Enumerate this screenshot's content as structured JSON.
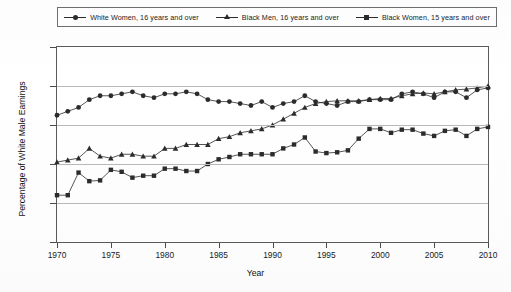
{
  "legend": {
    "entries": [
      {
        "label": "White Women, 16 years and over",
        "marker": "circle",
        "color": "#2b2b2b"
      },
      {
        "label": "Black Men, 16 years and over",
        "marker": "triangle",
        "color": "#2b2b2b"
      },
      {
        "label": "Black Women, 15 years and over",
        "marker": "square",
        "color": "#2b2b2b"
      }
    ]
  },
  "axes": {
    "y_title": "Percentage of White Male Earnings",
    "x_title": "Year",
    "y_ticks": [
      "0.90",
      "0.80",
      "0.70",
      "0.60",
      "0.50",
      "0.40"
    ],
    "x_ticks": [
      "1970",
      "1975",
      "1980",
      "1985",
      "1990",
      "1995",
      "2000",
      "2005",
      "2010"
    ]
  },
  "chart_data": {
    "type": "line",
    "title": "",
    "xlabel": "Year",
    "ylabel": "Percentage of White Male Earnings",
    "xlim": [
      1970,
      2010
    ],
    "ylim": [
      0.4,
      0.9
    ],
    "ytick_values": [
      0.9,
      0.8,
      0.7,
      0.6,
      0.5,
      0.4
    ],
    "xtick_values": [
      1970,
      1975,
      1980,
      1985,
      1990,
      1995,
      2000,
      2005,
      2010
    ],
    "grid": "horizontal",
    "legend_position": "top",
    "x": [
      1970,
      1971,
      1972,
      1973,
      1974,
      1975,
      1976,
      1977,
      1978,
      1979,
      1980,
      1981,
      1982,
      1983,
      1984,
      1985,
      1986,
      1987,
      1988,
      1989,
      1990,
      1991,
      1992,
      1993,
      1994,
      1995,
      1996,
      1997,
      1998,
      1999,
      2000,
      2001,
      2002,
      2003,
      2004,
      2005,
      2006,
      2007,
      2008,
      2009,
      2010
    ],
    "series": [
      {
        "name": "White Women, 16 years and over",
        "marker": "circle",
        "color": "#2b2b2b",
        "values": [
          0.725,
          0.735,
          0.745,
          0.765,
          0.775,
          0.775,
          0.78,
          0.785,
          0.775,
          0.77,
          0.78,
          0.78,
          0.785,
          0.78,
          0.765,
          0.76,
          0.76,
          0.755,
          0.75,
          0.76,
          0.745,
          0.755,
          0.76,
          0.775,
          0.76,
          0.755,
          0.75,
          0.76,
          0.76,
          0.765,
          0.765,
          0.765,
          0.78,
          0.785,
          0.78,
          0.77,
          0.785,
          0.785,
          0.77,
          0.79,
          0.795
        ]
      },
      {
        "name": "Black Men, 16 years and over",
        "marker": "triangle",
        "color": "#2b2b2b",
        "values": [
          0.605,
          0.61,
          0.615,
          0.64,
          0.62,
          0.615,
          0.625,
          0.625,
          0.62,
          0.62,
          0.64,
          0.64,
          0.65,
          0.65,
          0.65,
          0.665,
          0.67,
          0.68,
          0.685,
          0.69,
          0.7,
          0.715,
          0.73,
          0.745,
          0.755,
          0.76,
          0.762,
          0.762,
          0.762,
          0.765,
          0.768,
          0.768,
          0.775,
          0.78,
          0.782,
          0.78,
          0.785,
          0.79,
          0.792,
          0.795,
          0.8
        ]
      },
      {
        "name": "Black Women, 15 years and over",
        "marker": "square",
        "color": "#2b2b2b",
        "values": [
          0.52,
          0.52,
          0.578,
          0.556,
          0.558,
          0.585,
          0.58,
          0.565,
          0.57,
          0.57,
          0.588,
          0.588,
          0.582,
          0.582,
          0.6,
          0.612,
          0.618,
          0.625,
          0.625,
          0.625,
          0.625,
          0.64,
          0.65,
          0.668,
          0.632,
          0.628,
          0.63,
          0.635,
          0.665,
          0.69,
          0.69,
          0.68,
          0.688,
          0.688,
          0.678,
          0.672,
          0.685,
          0.688,
          0.672,
          0.69,
          0.695
        ]
      }
    ]
  }
}
